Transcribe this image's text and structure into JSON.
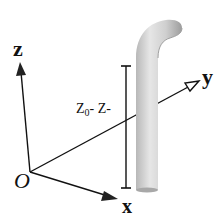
{
  "diagram": {
    "axes": {
      "z_label": "z",
      "y_label": "y",
      "x_label": "x",
      "origin_label": "O"
    },
    "dimension": {
      "label_main": "Z",
      "label_sub": "0",
      "label_rest": "- Z-"
    },
    "object": "curved-pipe",
    "colors": {
      "line": "#111111",
      "pipe_light": "#e4e4e4",
      "pipe_mid": "#c4c4c4",
      "pipe_dark": "#9a9a9a",
      "background": "#ffffff"
    }
  }
}
